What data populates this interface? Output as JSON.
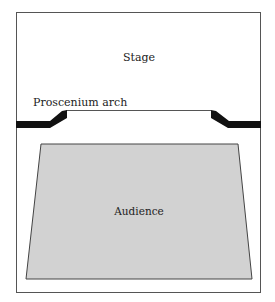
{
  "diagram": {
    "labels": {
      "stage": "Stage",
      "arch": "Proscenium arch",
      "audience": "Audience"
    },
    "colors": {
      "background": "#ffffff",
      "frame": "#555555",
      "arch_fill": "#111111",
      "audience_fill": "#d2d2d2",
      "audience_stroke": "#444444",
      "text": "#222222"
    }
  }
}
